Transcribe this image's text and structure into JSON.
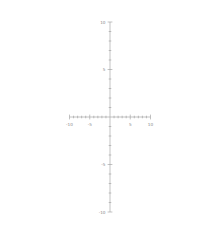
{
  "chart_data": {
    "type": "line",
    "title": "",
    "subtitle": "",
    "xlabel": "",
    "ylabel": "",
    "xlim": [
      -10,
      10
    ],
    "ylim": [
      -10,
      10
    ],
    "grid": false,
    "legend": null,
    "axis_style": "cartesian-cross",
    "line_color": "#7d7d7d",
    "axis_color": "#9a9a9a",
    "background_color": "#ffffff",
    "x_ticks": [
      -10,
      -9,
      -8,
      -7,
      -6,
      -5,
      -4,
      -3,
      -2,
      -1,
      1,
      2,
      3,
      4,
      5,
      6,
      7,
      8,
      9,
      10
    ],
    "y_ticks": [
      -10,
      -9,
      -8,
      -7,
      -6,
      -5,
      -4,
      -3,
      -2,
      -1,
      1,
      2,
      3,
      4,
      5,
      6,
      7,
      8,
      9,
      10
    ],
    "x_tick_labels": [
      {
        "value": -10,
        "text": "-10"
      },
      {
        "value": -5,
        "text": "-5"
      },
      {
        "value": 5,
        "text": "5"
      },
      {
        "value": 10,
        "text": "10"
      }
    ],
    "y_tick_labels": [
      {
        "value": 10,
        "text": "10"
      },
      {
        "value": 5,
        "text": "5"
      },
      {
        "value": -5,
        "text": "-5"
      },
      {
        "value": -10,
        "text": "-10"
      }
    ],
    "series": [
      {
        "name": "cubic",
        "expression": "y = 4x^3 + 4x^2 - 3x",
        "roots": [
          -1.75,
          0,
          0.43
        ],
        "local_max": {
          "x": -0.8,
          "y": 2.1
        },
        "local_min": {
          "x": 0.35,
          "y": -0.6
        },
        "x": [
          -1.95,
          -1.9,
          -1.85,
          -1.8,
          -1.75,
          -1.7,
          -1.65,
          -1.6,
          -1.55,
          -1.5,
          -1.45,
          -1.4,
          -1.35,
          -1.3,
          -1.25,
          -1.2,
          -1.15,
          -1.1,
          -1.05,
          -1.0,
          -0.95,
          -0.9,
          -0.85,
          -0.8,
          -0.75,
          -0.7,
          -0.65,
          -0.6,
          -0.55,
          -0.5,
          -0.45,
          -0.4,
          -0.35,
          -0.3,
          -0.25,
          -0.2,
          -0.15,
          -0.1,
          -0.05,
          0.0,
          0.05,
          0.1,
          0.15,
          0.2,
          0.25,
          0.3,
          0.35,
          0.4,
          0.45,
          0.5,
          0.55,
          0.6,
          0.65,
          0.7,
          0.75,
          0.8,
          0.85,
          0.9,
          0.95,
          1.0,
          1.05,
          1.1,
          1.15,
          1.2,
          1.25,
          1.3
        ],
        "y": [
          -11.5,
          -10.4,
          -9.4,
          -8.4,
          -7.4,
          -6.5,
          -5.7,
          -4.9,
          -4.1,
          -3.4,
          -2.7,
          -2.1,
          -1.5,
          -1.0,
          -0.5,
          -0.1,
          0.3,
          0.6,
          0.9,
          1.0,
          1.3,
          1.5,
          1.7,
          1.9,
          2.0,
          2.0,
          2.1,
          2.1,
          2.0,
          2.0,
          1.9,
          1.7,
          1.5,
          1.3,
          1.0,
          0.7,
          0.5,
          0.3,
          0.2,
          0.0,
          -0.1,
          -0.3,
          -0.4,
          -0.5,
          -0.6,
          -0.6,
          -0.6,
          -0.5,
          -0.4,
          -0.2,
          0.1,
          0.5,
          1.0,
          1.6,
          2.3,
          3.2,
          4.1,
          5.2,
          6.4,
          7.8,
          9.2,
          10.9,
          12.6,
          14.5,
          16.5,
          18.7
        ]
      }
    ]
  }
}
